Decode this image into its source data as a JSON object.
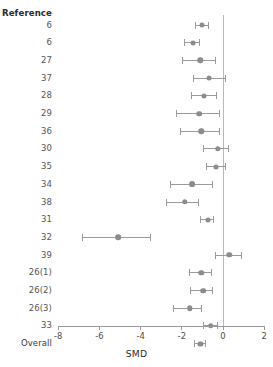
{
  "chart_data": {
    "type": "scatter",
    "subtype": "forest-plot",
    "title": "",
    "xlabel": "SMD",
    "ylabel": "Reference",
    "xlim": [
      -8,
      2
    ],
    "xticks": [
      -8,
      -6,
      -4,
      -2,
      0,
      2
    ],
    "xtick_labels": [
      "-8",
      "-6",
      "-4",
      "-2",
      "0",
      "2"
    ],
    "grid": false,
    "legend": null,
    "reference_line": 0,
    "column_header": "Reference",
    "effect_measure": "SMD",
    "rows": [
      {
        "label": "6",
        "estimate": -1.0,
        "ci_low": -1.35,
        "ci_high": -0.7,
        "marker_size": 5.0
      },
      {
        "label": "6",
        "estimate": -1.45,
        "ci_low": -1.85,
        "ci_high": -1.15,
        "marker_size": 5.0
      },
      {
        "label": "27",
        "estimate": -1.1,
        "ci_low": -1.95,
        "ci_high": -0.35,
        "marker_size": 5.4
      },
      {
        "label": "37",
        "estimate": -0.7,
        "ci_low": -1.45,
        "ci_high": 0.1,
        "marker_size": 5.0
      },
      {
        "label": "28",
        "estimate": -0.9,
        "ci_low": -1.55,
        "ci_high": -0.3,
        "marker_size": 5.0
      },
      {
        "label": "29",
        "estimate": -1.15,
        "ci_low": -2.25,
        "ci_high": -0.15,
        "marker_size": 5.6
      },
      {
        "label": "36",
        "estimate": -1.05,
        "ci_low": -2.05,
        "ci_high": -0.15,
        "marker_size": 5.4
      },
      {
        "label": "30",
        "estimate": -0.25,
        "ci_low": -0.95,
        "ci_high": 0.25,
        "marker_size": 5.4
      },
      {
        "label": "35",
        "estimate": -0.35,
        "ci_low": -0.8,
        "ci_high": 0.1,
        "marker_size": 5.0
      },
      {
        "label": "34",
        "estimate": -1.5,
        "ci_low": -2.55,
        "ci_high": -0.5,
        "marker_size": 5.8
      },
      {
        "label": "38",
        "estimate": -1.85,
        "ci_low": -2.75,
        "ci_high": -1.2,
        "marker_size": 5.4
      },
      {
        "label": "31",
        "estimate": -0.75,
        "ci_low": -1.1,
        "ci_high": -0.45,
        "marker_size": 5.0
      },
      {
        "label": "32",
        "estimate": -5.1,
        "ci_low": -6.8,
        "ci_high": -3.5,
        "marker_size": 5.6
      },
      {
        "label": "39",
        "estimate": 0.3,
        "ci_low": -0.35,
        "ci_high": 0.9,
        "marker_size": 5.4
      },
      {
        "label": "26(1)",
        "estimate": -1.05,
        "ci_low": -1.65,
        "ci_high": -0.55,
        "marker_size": 5.4
      },
      {
        "label": "26(2)",
        "estimate": -0.95,
        "ci_low": -1.6,
        "ci_high": -0.5,
        "marker_size": 5.6
      },
      {
        "label": "26(3)",
        "estimate": -1.6,
        "ci_low": -2.4,
        "ci_high": -1.05,
        "marker_size": 5.4
      },
      {
        "label": "33",
        "estimate": -0.6,
        "ci_low": -0.95,
        "ci_high": -0.25,
        "marker_size": 5.6
      },
      {
        "label": "Overall",
        "estimate": -1.1,
        "ci_low": -1.4,
        "ci_high": -0.85,
        "marker_size": 5.2
      }
    ]
  },
  "style": {
    "marker_color": "#8c8c8c",
    "line_color": "#9a9a9a",
    "axis_color": "#9a9a9a",
    "reference_line_color": "#b9b9b9",
    "label_color": "#555555",
    "header_color": "#2b2b2b",
    "background": "#ffffff"
  }
}
